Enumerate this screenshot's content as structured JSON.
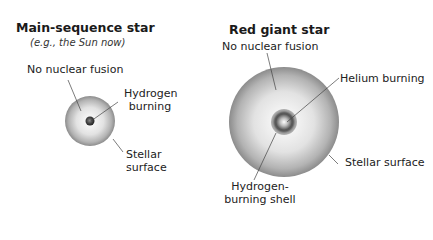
{
  "main_sequence": {
    "title": "Main-sequence star",
    "subtitle": "(e.g., the Sun now)",
    "labels": {
      "no_fusion": "No nuclear fusion",
      "hydrogen_line1": "Hydrogen",
      "hydrogen_line2": "burning",
      "surface_line1": "Stellar",
      "surface_line2": "surface"
    }
  },
  "red_giant": {
    "title": "Red giant star",
    "labels": {
      "no_fusion": "No nuclear fusion",
      "helium": "Helium burning",
      "surface": "Stellar surface",
      "shell_line1": "Hydrogen-",
      "shell_line2": "burning shell"
    }
  }
}
